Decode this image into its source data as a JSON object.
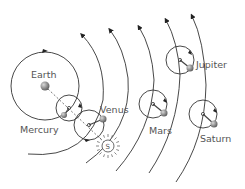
{
  "diagram": {
    "labels": {
      "earth": "Earth",
      "mercury": "Mercury",
      "venus": "Venus",
      "sun": "S",
      "mars": "Mars",
      "jupiter": "Jupiter",
      "saturn": "Saturn"
    },
    "bodies": [
      {
        "name": "Earth",
        "type": "center"
      },
      {
        "name": "Mercury",
        "type": "planet-on-epicycle"
      },
      {
        "name": "Venus",
        "type": "planet-on-epicycle"
      },
      {
        "name": "S",
        "type": "sun"
      },
      {
        "name": "Mars",
        "type": "planet-on-epicycle"
      },
      {
        "name": "Jupiter",
        "type": "planet-on-epicycle"
      },
      {
        "name": "Saturn",
        "type": "planet-on-epicycle"
      }
    ],
    "colors": {
      "line": "#333333",
      "planet": "#777777",
      "label": "#555555"
    }
  }
}
